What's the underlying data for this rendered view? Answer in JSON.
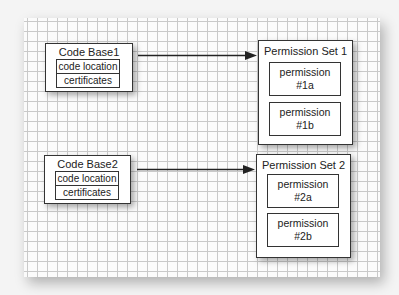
{
  "diagram": {
    "code_bases": [
      {
        "title": "Code Base1",
        "fields": [
          "code location",
          "certificates"
        ]
      },
      {
        "title": "Code Base2",
        "fields": [
          "code location",
          "certificates"
        ]
      }
    ],
    "permission_sets": [
      {
        "title": "Permission Set 1",
        "permissions": [
          {
            "line1": "permission",
            "line2": "#1a"
          },
          {
            "line1": "permission",
            "line2": "#1b"
          }
        ]
      },
      {
        "title": "Permission Set 2",
        "permissions": [
          {
            "line1": "permission",
            "line2": "#2a"
          },
          {
            "line1": "permission",
            "line2": "#2b"
          }
        ]
      }
    ],
    "connections": [
      {
        "from": "Code Base1",
        "to": "Permission Set 1"
      },
      {
        "from": "Code Base2",
        "to": "Permission Set 2"
      }
    ]
  }
}
